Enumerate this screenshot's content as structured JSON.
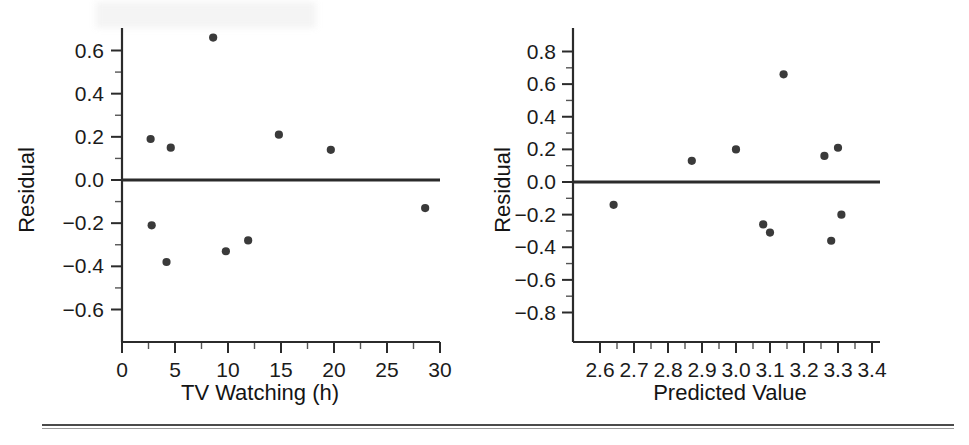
{
  "figure": {
    "title": "",
    "panel_count": 2,
    "background_color": "#ffffff",
    "dot_color": "#3a3a3a",
    "axis_color": "#2b2b2b"
  },
  "chart_data": [
    {
      "type": "scatter",
      "id": "residual-vs-tv-watching",
      "title": "",
      "xlabel": "TV Watching (h)",
      "ylabel": "Residual",
      "xlim": [
        0,
        30
      ],
      "ylim": [
        -0.7,
        0.72
      ],
      "grid": false,
      "legend": false,
      "xticks": [
        0,
        5,
        10,
        15,
        20,
        25,
        30
      ],
      "xticklabels": [
        "0",
        "5",
        "10",
        "15",
        "20",
        "25",
        "30"
      ],
      "xminor_step": 2.5,
      "yticks": [
        -0.6,
        -0.4,
        -0.2,
        0.0,
        0.2,
        0.4,
        0.6
      ],
      "yticklabels": [
        "−0.6",
        "−0.4",
        "−0.2",
        "0.0",
        "0.2",
        "0.4",
        "0.6"
      ],
      "yminor_step": 0.1,
      "reference_line": {
        "y": 0.0,
        "label": "zero-residual-line"
      },
      "points": [
        {
          "x": 2.7,
          "y": 0.19
        },
        {
          "x": 4.6,
          "y": 0.15
        },
        {
          "x": 8.6,
          "y": 0.66
        },
        {
          "x": 14.8,
          "y": 0.21
        },
        {
          "x": 19.7,
          "y": 0.14
        },
        {
          "x": 2.8,
          "y": -0.21
        },
        {
          "x": 4.2,
          "y": -0.38
        },
        {
          "x": 9.8,
          "y": -0.33
        },
        {
          "x": 11.9,
          "y": -0.28
        },
        {
          "x": 28.6,
          "y": -0.13
        }
      ]
    },
    {
      "type": "scatter",
      "id": "residual-vs-predicted-value",
      "title": "",
      "xlabel": "Predicted Value",
      "ylabel": "Residual",
      "xlim": [
        2.55,
        3.43
      ],
      "ylim": [
        -0.9,
        0.92
      ],
      "grid": false,
      "legend": false,
      "xticks": [
        2.6,
        2.7,
        2.8,
        2.9,
        3.0,
        3.1,
        3.2,
        3.3,
        3.4
      ],
      "xticklabels": [
        "2.6",
        "2.7",
        "2.8",
        "2.9",
        "3.0",
        "3.1",
        "3.2",
        "3.3",
        "3.4"
      ],
      "xminor_step": 0.05,
      "yticks": [
        -0.8,
        -0.6,
        -0.4,
        -0.2,
        0.0,
        0.2,
        0.4,
        0.6,
        0.8
      ],
      "yticklabels": [
        "−0.8",
        "−0.6",
        "−0.4",
        "−0.2",
        "0.0",
        "0.2",
        "0.4",
        "0.6",
        "0.8"
      ],
      "yminor_step": 0.1,
      "reference_line": {
        "y": 0.0,
        "label": "zero-residual-line"
      },
      "points": [
        {
          "x": 2.64,
          "y": -0.14
        },
        {
          "x": 2.87,
          "y": 0.13
        },
        {
          "x": 3.0,
          "y": 0.2
        },
        {
          "x": 3.14,
          "y": 0.66
        },
        {
          "x": 3.08,
          "y": -0.26
        },
        {
          "x": 3.1,
          "y": -0.31
        },
        {
          "x": 3.26,
          "y": 0.16
        },
        {
          "x": 3.3,
          "y": 0.21
        },
        {
          "x": 3.28,
          "y": -0.36
        },
        {
          "x": 3.31,
          "y": -0.2
        }
      ]
    }
  ]
}
